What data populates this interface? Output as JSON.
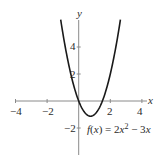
{
  "chart_data": {
    "type": "line",
    "title": "",
    "function": "f(x) = 2x^2 - 3x",
    "annotation": "f(x) = 2x² − 3x",
    "xlabel": "x",
    "ylabel": "y",
    "xlim": [
      -4,
      4.3
    ],
    "ylim": [
      -4,
      6.2
    ],
    "x_ticks": [
      -4,
      -2,
      2,
      4
    ],
    "x_tick_labels": [
      "−4",
      "−2",
      "2",
      "4"
    ],
    "y_ticks": [
      -2,
      2,
      4
    ],
    "y_tick_labels": [
      "−2",
      "2",
      "4"
    ],
    "grid": false,
    "legend": null,
    "series": [
      {
        "name": "f(x) = 2x² − 3x",
        "x": [
          -1.14,
          -1.0,
          -0.75,
          -0.5,
          -0.25,
          0,
          0.25,
          0.5,
          0.75,
          1.0,
          1.25,
          1.5,
          1.75,
          2.0,
          2.25,
          2.5,
          2.64
        ],
        "y": [
          6.02,
          5.0,
          3.375,
          2.0,
          0.875,
          0,
          -0.625,
          -1.0,
          -1.125,
          -1.0,
          -0.625,
          0,
          0.875,
          2.0,
          3.375,
          5.0,
          6.02
        ],
        "color": "#1a1a1a"
      }
    ],
    "vertex": {
      "x": 0.75,
      "y": -1.125
    }
  },
  "labels": {
    "x_axis": "x",
    "y_axis": "y",
    "x_ticks": [
      "−4",
      "−2",
      "2",
      "4"
    ],
    "y_ticks": [
      "4",
      "2",
      "−2"
    ],
    "formula_f": "f",
    "formula_paren_open": "(",
    "formula_x": "x",
    "formula_paren_close": ")",
    "formula_eq": " = 2",
    "formula_x2": "x",
    "formula_sup": "2",
    "formula_minus": " − 3",
    "formula_x3": "x"
  },
  "colors": {
    "axis": "#8a8a8a",
    "curve": "#1a1a1a",
    "text": "#2b2b2b"
  }
}
